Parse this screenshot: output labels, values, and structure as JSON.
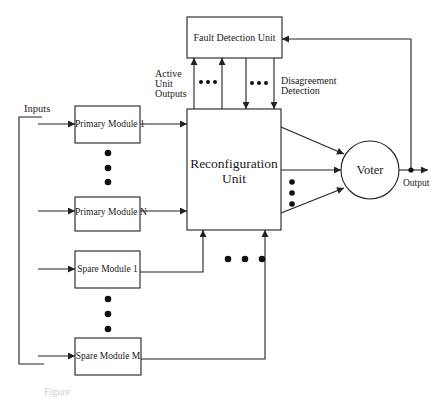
{
  "diagram": {
    "colors": {
      "stroke": "#222222",
      "background": "#ffffff",
      "caption": "#cfcfcf"
    },
    "nodes": {
      "fault_detection_unit": {
        "label": "Fault Detection Unit"
      },
      "reconfiguration_unit": {
        "label_line1": "Reconfiguration",
        "label_line2": "Unit"
      },
      "voter": {
        "label": "Voter"
      },
      "primary_module_1": {
        "label": "Primary Module 1"
      },
      "primary_module_n": {
        "label": "Primary Module N"
      },
      "spare_module_1": {
        "label": "Spare Module 1"
      },
      "spare_module_m": {
        "label": "Spare Module M"
      }
    },
    "labels": {
      "inputs": "Inputs",
      "active_unit_outputs_line1": "Active",
      "active_unit_outputs_line2": "Unit",
      "active_unit_outputs_line3": "Outputs",
      "disagreement_detection_line1": "Disagreement",
      "disagreement_detection_line2": "Detection",
      "output": "Output"
    },
    "edges": [
      {
        "from": "inputs",
        "to": "primary_module_1"
      },
      {
        "from": "inputs",
        "to": "primary_module_n"
      },
      {
        "from": "inputs",
        "to": "spare_module_1"
      },
      {
        "from": "inputs",
        "to": "spare_module_m"
      },
      {
        "from": "primary_module_1",
        "to": "reconfiguration_unit"
      },
      {
        "from": "primary_module_n",
        "to": "reconfiguration_unit"
      },
      {
        "from": "spare_module_1",
        "to": "reconfiguration_unit"
      },
      {
        "from": "spare_module_m",
        "to": "reconfiguration_unit"
      },
      {
        "from": "reconfiguration_unit",
        "to": "fault_detection_unit",
        "label": "Active Unit Outputs"
      },
      {
        "from": "fault_detection_unit",
        "to": "reconfiguration_unit",
        "label": "Disagreement Detection"
      },
      {
        "from": "reconfiguration_unit",
        "to": "voter"
      },
      {
        "from": "voter",
        "to": "output"
      },
      {
        "from": "output",
        "to": "fault_detection_unit"
      }
    ],
    "caption": "Figure"
  }
}
